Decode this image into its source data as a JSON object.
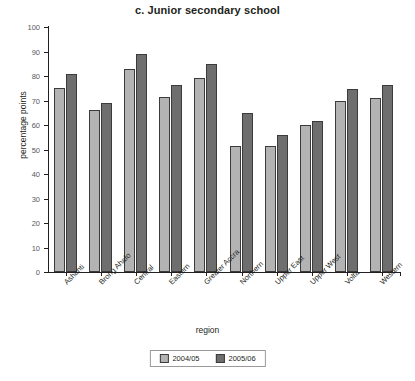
{
  "chart_data": {
    "type": "bar",
    "title": "c. Junior secondary school",
    "xlabel": "region",
    "ylabel": "percentage points",
    "ylim": [
      0,
      100
    ],
    "yticks": [
      0,
      10,
      20,
      30,
      40,
      50,
      60,
      70,
      80,
      90,
      100
    ],
    "grid": false,
    "legend_position": "bottom",
    "categories": [
      "Ashanti",
      "Brong Ahafo",
      "Central",
      "Eastern",
      "Greater Accra",
      "Northern",
      "Upper East",
      "Upper West",
      "Volta",
      "Western"
    ],
    "series": [
      {
        "name": "2004/05",
        "color": "#b3b3b3",
        "values": [
          75,
          66,
          83,
          71.5,
          79,
          51.5,
          51.5,
          60,
          70,
          71
        ]
      },
      {
        "name": "2005/06",
        "color": "#6e6e6e",
        "values": [
          81,
          69,
          89,
          76.5,
          85,
          65,
          56,
          61.5,
          74.5,
          76.5
        ]
      }
    ]
  },
  "legend": {
    "items": [
      {
        "label": "2004/05"
      },
      {
        "label": "2005/06"
      }
    ]
  }
}
